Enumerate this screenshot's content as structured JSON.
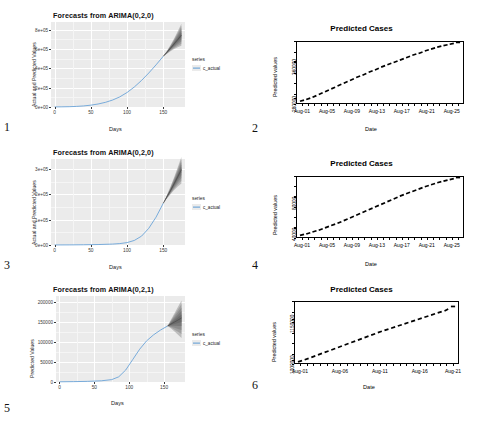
{
  "figure": {
    "layout": "2-column x 3-row panel grid",
    "panel_numbers": [
      "1",
      "2",
      "3",
      "4",
      "5",
      "6"
    ]
  },
  "panels": [
    {
      "number": "1",
      "style": "ggplot",
      "title": "Forecasts from ARIMA(0,2,0)",
      "ylabel": "Actual and Predicted Values",
      "xlabel": "Days",
      "yticks": [
        "0e+00",
        "2e+05",
        "4e+05",
        "6e+05",
        "8e+05"
      ],
      "xticks": [
        "0",
        "50",
        "100",
        "150"
      ],
      "legend_title": "series",
      "legend_items": [
        "c_actual"
      ]
    },
    {
      "number": "2",
      "style": "base-r",
      "title": "Predicted Cases",
      "ylabel": "Predicted values",
      "xlabel": "Date",
      "yticks": [
        "280000",
        "360000"
      ],
      "xticks": [
        "Aug-01",
        "Aug-05",
        "Aug-09",
        "Aug-13",
        "Aug-17",
        "Aug-21",
        "Aug-25"
      ]
    },
    {
      "number": "3",
      "style": "ggplot",
      "title": "Forecasts from ARIMA(0,2,0)",
      "ylabel": "Actual and Predicted Values",
      "xlabel": "Days",
      "yticks": [
        "0e+00",
        "1e+05",
        "2e+05",
        "3e+05"
      ],
      "xticks": [
        "0",
        "50",
        "100",
        "150"
      ],
      "legend_title": "series",
      "legend_items": [
        "c_actual"
      ]
    },
    {
      "number": "4",
      "style": "base-r",
      "title": "Predicted Cases",
      "ylabel": "Predicted values",
      "xlabel": "Date",
      "yticks": [
        "40000",
        "80000"
      ],
      "xticks": [
        "Aug-01",
        "Aug-05",
        "Aug-09",
        "Aug-13",
        "Aug-17",
        "Aug-21",
        "Aug-25"
      ]
    },
    {
      "number": "5",
      "style": "ggplot",
      "title": "Forecasts from ARIMA(0,2,1)",
      "ylabel": "Predicted Values",
      "xlabel": "Days",
      "yticks": [
        "0",
        "50000",
        "100000",
        "150000",
        "200000"
      ],
      "xticks": [
        "0",
        "50",
        "100",
        "150"
      ],
      "legend_title": "series",
      "legend_items": [
        "c_actual"
      ]
    },
    {
      "number": "6",
      "style": "base-r",
      "title": "Predicted Cases",
      "ylabel": "Predicted values",
      "xlabel": "Date",
      "yticks": [
        "1000000",
        "1150000"
      ],
      "xticks": [
        "Aug-01",
        "Aug-06",
        "Aug-11",
        "Aug-16",
        "Aug-21"
      ]
    }
  ],
  "colors": {
    "panel_background": "#ebebeb",
    "gridline": "#ffffff",
    "series_line": "#5b9bd5",
    "forecast_fan": "#6a6a6a",
    "axis": "#000000",
    "text": "#1a1a1a"
  },
  "chart_data": [
    {
      "type": "line",
      "panel": "1",
      "title": "Forecasts from ARIMA(0,2,0)",
      "xlabel": "Days",
      "ylabel": "Actual and Predicted Values",
      "xlim": [
        -5,
        180
      ],
      "ylim": [
        0,
        880000
      ],
      "xticks": [
        0,
        50,
        100,
        150
      ],
      "ytick_labels": [
        "0e+00",
        "2e+05",
        "4e+05",
        "6e+05",
        "8e+05"
      ],
      "ytick_values": [
        0,
        200000,
        400000,
        600000,
        800000
      ],
      "grid": true,
      "legend_position": "right",
      "series": [
        {
          "name": "c_actual",
          "x": [
            0,
            10,
            20,
            30,
            40,
            50,
            60,
            70,
            80,
            90,
            100,
            110,
            120,
            130,
            140,
            150
          ],
          "values": [
            900,
            1800,
            3200,
            6000,
            11000,
            19000,
            31000,
            48000,
            72000,
            105000,
            150000,
            207000,
            275000,
            352000,
            436000,
            525000
          ]
        },
        {
          "name": "forecast_mean",
          "x": [
            150,
            155,
            160,
            165,
            170,
            175
          ],
          "values": [
            525000,
            566000,
            609000,
            653000,
            698000,
            744000
          ]
        }
      ],
      "forecast_interval": {
        "x": [
          150,
          155,
          160,
          165,
          170,
          175
        ],
        "lower_95": [
          525000,
          552000,
          578000,
          600000,
          618000,
          633000
        ],
        "upper_95": [
          525000,
          580000,
          642000,
          710000,
          784000,
          862000
        ]
      }
    },
    {
      "type": "scatter",
      "panel": "2",
      "title": "Predicted Cases",
      "xlabel": "Date",
      "ylabel": "Predicted values",
      "xtick_labels": [
        "Aug-01",
        "Aug-05",
        "Aug-09",
        "Aug-13",
        "Aug-17",
        "Aug-21",
        "Aug-25"
      ],
      "ytick_labels": [
        "280000",
        "360000"
      ],
      "ytick_values": [
        280000,
        360000
      ],
      "ylim": [
        268000,
        402000
      ],
      "grid": false,
      "x": [
        "Aug-01",
        "Aug-02",
        "Aug-03",
        "Aug-04",
        "Aug-05",
        "Aug-06",
        "Aug-07",
        "Aug-08",
        "Aug-09",
        "Aug-10",
        "Aug-11",
        "Aug-12",
        "Aug-13",
        "Aug-14",
        "Aug-15",
        "Aug-16",
        "Aug-17",
        "Aug-18",
        "Aug-19",
        "Aug-20",
        "Aug-21",
        "Aug-22",
        "Aug-23",
        "Aug-24",
        "Aug-25",
        "Aug-26"
      ],
      "values": [
        275000,
        279000,
        284000,
        290000,
        296000,
        302000,
        308000,
        314000,
        320000,
        326000,
        331000,
        337000,
        342000,
        348000,
        353000,
        358000,
        363000,
        368000,
        373000,
        377000,
        382000,
        386000,
        390000,
        393000,
        396000,
        399000
      ]
    },
    {
      "type": "line",
      "panel": "3",
      "title": "Forecasts from ARIMA(0,2,0)",
      "xlabel": "Days",
      "ylabel": "Actual and Predicted Values",
      "xlim": [
        -5,
        180
      ],
      "ylim": [
        0,
        340000
      ],
      "xticks": [
        0,
        50,
        100,
        150
      ],
      "ytick_labels": [
        "0e+00",
        "1e+05",
        "2e+05",
        "3e+05"
      ],
      "ytick_values": [
        0,
        100000,
        200000,
        300000
      ],
      "grid": true,
      "legend_position": "right",
      "series": [
        {
          "name": "c_actual",
          "x": [
            0,
            20,
            40,
            60,
            80,
            90,
            100,
            110,
            120,
            130,
            140,
            150
          ],
          "values": [
            200,
            400,
            900,
            1800,
            3600,
            5600,
            9500,
            18000,
            35000,
            66000,
            110000,
            165000
          ]
        },
        {
          "name": "forecast_mean",
          "x": [
            150,
            155,
            160,
            165,
            170,
            175
          ],
          "values": [
            165000,
            190000,
            215000,
            242000,
            270000,
            298000
          ]
        }
      ],
      "forecast_interval": {
        "x": [
          150,
          155,
          160,
          165,
          170,
          175
        ],
        "lower_95": [
          165000,
          184000,
          201000,
          217000,
          231000,
          243000
        ],
        "upper_95": [
          165000,
          197000,
          231000,
          268000,
          307000,
          348000
        ]
      }
    },
    {
      "type": "scatter",
      "panel": "4",
      "title": "Predicted Cases",
      "xlabel": "Date",
      "ylabel": "Predicted values",
      "xtick_labels": [
        "Aug-01",
        "Aug-05",
        "Aug-09",
        "Aug-13",
        "Aug-17",
        "Aug-21",
        "Aug-25"
      ],
      "ytick_labels": [
        "40000",
        "80000"
      ],
      "ytick_values": [
        40000,
        80000
      ],
      "ylim": [
        26000,
        106000
      ],
      "grid": false,
      "x": [
        "Aug-01",
        "Aug-02",
        "Aug-03",
        "Aug-04",
        "Aug-05",
        "Aug-06",
        "Aug-07",
        "Aug-08",
        "Aug-09",
        "Aug-10",
        "Aug-11",
        "Aug-12",
        "Aug-13",
        "Aug-14",
        "Aug-15",
        "Aug-16",
        "Aug-17",
        "Aug-18",
        "Aug-19",
        "Aug-20",
        "Aug-21",
        "Aug-22",
        "Aug-23",
        "Aug-24",
        "Aug-25",
        "Aug-26"
      ],
      "values": [
        30000,
        32000,
        34500,
        37000,
        40000,
        43000,
        46000,
        49500,
        53000,
        56500,
        60000,
        63500,
        67000,
        70500,
        74000,
        77500,
        81000,
        84000,
        87000,
        90000,
        93000,
        95500,
        98000,
        100000,
        102000,
        104000
      ]
    },
    {
      "type": "line",
      "panel": "5",
      "title": "Forecasts from ARIMA(0,2,1)",
      "xlabel": "Days",
      "ylabel": "Predicted Values",
      "xlim": [
        -5,
        180
      ],
      "ylim": [
        0,
        215000
      ],
      "xticks": [
        0,
        50,
        100,
        150
      ],
      "ytick_labels": [
        "0",
        "50000",
        "100000",
        "150000",
        "200000"
      ],
      "ytick_values": [
        0,
        50000,
        100000,
        150000,
        200000
      ],
      "grid": true,
      "legend_position": "right",
      "series": [
        {
          "name": "c_actual",
          "x": [
            0,
            20,
            40,
            60,
            75,
            85,
            95,
            105,
            115,
            125,
            135,
            145,
            155
          ],
          "values": [
            500,
            900,
            1600,
            3000,
            6000,
            13000,
            30000,
            56000,
            82000,
            103000,
            118000,
            130000,
            140000
          ]
        },
        {
          "name": "forecast_mean",
          "x": [
            155,
            160,
            165,
            170,
            175
          ],
          "values": [
            140000,
            145000,
            150000,
            155000,
            160000
          ]
        }
      ],
      "forecast_interval": {
        "x": [
          155,
          160,
          165,
          170,
          175
        ],
        "lower_95": [
          140000,
          134000,
          126000,
          118000,
          110000
        ],
        "upper_95": [
          140000,
          156000,
          172000,
          188000,
          204000
        ]
      }
    },
    {
      "type": "scatter",
      "panel": "6",
      "title": "Predicted Cases",
      "xlabel": "Date",
      "ylabel": "Predicted values",
      "xtick_labels": [
        "Aug-01",
        "Aug-06",
        "Aug-11",
        "Aug-16",
        "Aug-21"
      ],
      "ytick_labels": [
        "1000000",
        "1150000"
      ],
      "ytick_values": [
        1000000,
        1150000
      ],
      "ylim": [
        985000,
        1215000
      ],
      "grid": false,
      "x": [
        "Aug-01",
        "Aug-02",
        "Aug-03",
        "Aug-04",
        "Aug-05",
        "Aug-06",
        "Aug-07",
        "Aug-08",
        "Aug-09",
        "Aug-10",
        "Aug-11",
        "Aug-12",
        "Aug-13",
        "Aug-14",
        "Aug-15",
        "Aug-16",
        "Aug-17",
        "Aug-18",
        "Aug-19",
        "Aug-20",
        "Aug-21",
        "Aug-22",
        "Aug-23",
        "Aug-24"
      ],
      "values": [
        995000,
        1003000,
        1012000,
        1021000,
        1030000,
        1039000,
        1048000,
        1057000,
        1066000,
        1075000,
        1084000,
        1093000,
        1102000,
        1110000,
        1118000,
        1126000,
        1134000,
        1142000,
        1150000,
        1158000,
        1166000,
        1174000,
        1182000,
        1195000
      ]
    }
  ]
}
